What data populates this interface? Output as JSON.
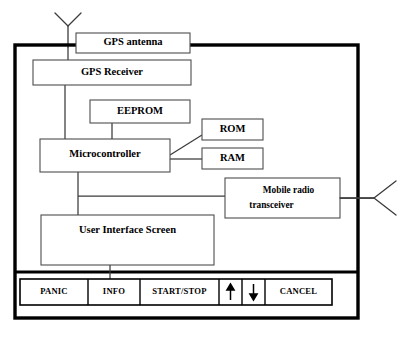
{
  "figure": {
    "type": "block-diagram",
    "canvas": {
      "width": 403,
      "height": 340
    },
    "stroke_color": "#3b3b3b",
    "shell_color": "#000000",
    "background": "#ffffff"
  },
  "blocks": {
    "gps_antenna": {
      "label": "GPS antenna",
      "x": 76,
      "y": 33,
      "w": 114,
      "h": 20
    },
    "gps_receiver": {
      "label": "GPS Receiver",
      "x": 33,
      "y": 60,
      "w": 158,
      "h": 25
    },
    "eeprom": {
      "label": "EEPROM",
      "x": 90,
      "y": 100,
      "w": 100,
      "h": 23
    },
    "rom": {
      "label": "ROM",
      "x": 202,
      "y": 119,
      "w": 61,
      "h": 21
    },
    "ram": {
      "label": "RAM",
      "x": 202,
      "y": 148,
      "w": 61,
      "h": 21
    },
    "microcontroller": {
      "label": "Microcontroller",
      "x": 40,
      "y": 139,
      "w": 130,
      "h": 33
    },
    "transceiver": {
      "label_line1": "Mobile     radio",
      "label_line2": "transceiver",
      "x": 225,
      "y": 178,
      "w": 115,
      "h": 40
    },
    "ui_screen": {
      "label": "User Interface Screen",
      "x": 41,
      "y": 215,
      "w": 173,
      "h": 50
    }
  },
  "device_shell": {
    "x": 15,
    "y": 45,
    "w": 343,
    "h": 273,
    "panel_divider_y": 272
  },
  "button_bar": {
    "x": 20,
    "y": 279,
    "w": 312,
    "h": 26,
    "buttons": [
      {
        "name": "panic",
        "label": "PANIC",
        "x": 20,
        "w": 68,
        "kind": "text"
      },
      {
        "name": "info",
        "label": "INFO",
        "x": 88,
        "w": 52,
        "kind": "text"
      },
      {
        "name": "start-stop",
        "label": "START/STOP",
        "x": 140,
        "w": 79,
        "kind": "text"
      },
      {
        "name": "up",
        "label": "",
        "x": 219,
        "w": 23,
        "kind": "arrow-up"
      },
      {
        "name": "down",
        "label": "",
        "x": 242,
        "w": 23,
        "kind": "arrow-down"
      },
      {
        "name": "cancel",
        "label": "CANCEL",
        "x": 265,
        "w": 67,
        "kind": "text"
      }
    ]
  },
  "antennas": {
    "gps": {
      "name": "gps-antenna-symbol",
      "stem_x": 68,
      "stem_top": 26,
      "stem_bottom": 47,
      "left_tip_x": 55,
      "right_tip_x": 81,
      "tip_y": 13
    },
    "radio": {
      "name": "radio-antenna-symbol",
      "apex_x": 374,
      "apex_y": 198,
      "upper_tip_x": 396,
      "upper_tip_y": 181,
      "lower_tip_x": 396,
      "lower_tip_y": 215,
      "lead_x1": 340,
      "lead_x2": 374,
      "lead_y": 198
    }
  },
  "connections": [
    {
      "name": "antenna-to-receiver",
      "from": "gps-antenna",
      "to": "gps-receiver",
      "points": "68,47 68,60"
    },
    {
      "name": "receiver-to-microcontroller",
      "from": "gps-receiver",
      "to": "microcontroller",
      "points": "65,85 65,139"
    },
    {
      "name": "eeprom-to-microcontroller",
      "from": "eeprom",
      "to": "microcontroller",
      "points": "112,123 112,139"
    },
    {
      "name": "microcontroller-to-rom",
      "from": "microcontroller",
      "to": "rom",
      "points": "170,155 202,135"
    },
    {
      "name": "microcontroller-to-ram",
      "from": "microcontroller",
      "to": "ram",
      "points": "170,159 202,159"
    },
    {
      "name": "microcontroller-bus-down",
      "from": "microcontroller",
      "to": "ui-screen",
      "points": "78,172 78,215"
    },
    {
      "name": "bus-to-transceiver",
      "from": "microcontroller-bus",
      "to": "transceiver",
      "points": "78,196 225,196"
    },
    {
      "name": "transceiver-to-radio-antenna",
      "from": "transceiver",
      "to": "radio-antenna",
      "points": "340,198 374,198"
    },
    {
      "name": "ui-screen-to-button-bar",
      "from": "ui-screen",
      "to": "button-bar",
      "points": "110,265 110,279"
    }
  ]
}
